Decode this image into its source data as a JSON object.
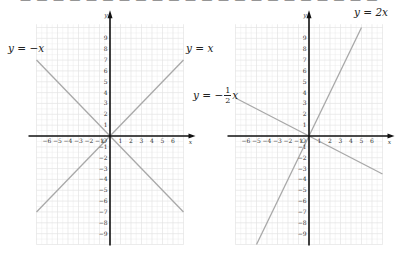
{
  "top_clipped_text": "— — — — — — — — — — — — — — — — — — — — — —",
  "chart_data": [
    {
      "type": "line",
      "title": "",
      "xlabel": "x",
      "ylabel": "y",
      "xlim": [
        -7,
        7
      ],
      "ylim": [
        -10,
        10
      ],
      "x_ticks": [
        -6,
        -5,
        -4,
        -3,
        -2,
        -1,
        1,
        2,
        3,
        4,
        5,
        6
      ],
      "y_ticks": [
        9,
        8,
        7,
        6,
        5,
        4,
        3,
        2,
        1,
        -1,
        -2,
        -3,
        -4,
        -5,
        -6,
        -7,
        -8,
        -9
      ],
      "origin_label": "O",
      "grid": true,
      "series": [
        {
          "name": "y=-x",
          "slope": -1,
          "x": [
            -7,
            7
          ],
          "y": [
            7,
            -7
          ]
        },
        {
          "name": "y=x",
          "slope": 1,
          "x": [
            -7,
            7
          ],
          "y": [
            -7,
            7
          ]
        }
      ]
    },
    {
      "type": "line",
      "title": "",
      "xlabel": "x",
      "ylabel": "y",
      "xlim": [
        -7,
        7
      ],
      "ylim": [
        -10,
        10
      ],
      "x_ticks": [
        -6,
        -5,
        -4,
        -3,
        -2,
        -1,
        1,
        2,
        3,
        4,
        5,
        6
      ],
      "y_ticks": [
        9,
        8,
        7,
        6,
        5,
        4,
        3,
        2,
        1,
        -1,
        -2,
        -3,
        -4,
        -5,
        -6,
        -7,
        -8,
        -9
      ],
      "origin_label": "O",
      "grid": true,
      "series": [
        {
          "name": "y=2x",
          "slope": 2,
          "x": [
            -5,
            5
          ],
          "y": [
            -10,
            10
          ]
        },
        {
          "name": "y=-1/2 x",
          "slope": -0.5,
          "x": [
            -7,
            7
          ],
          "y": [
            3.5,
            -3.5
          ]
        }
      ]
    }
  ],
  "labels": {
    "left_neg": {
      "prefix": "y = −x"
    },
    "left_pos": {
      "prefix": "y = x"
    },
    "right_two": {
      "prefix": "y = 2x"
    },
    "right_half": {
      "prefix": "y = −",
      "num": "1",
      "den": "2",
      "suffix": "x"
    }
  },
  "axis": {
    "x": "x",
    "y": "y",
    "origin": "O"
  },
  "colors": {
    "line": "#a8a8a8",
    "axis": "#111111",
    "grid": "#e4e4e4",
    "text": "#222222"
  }
}
